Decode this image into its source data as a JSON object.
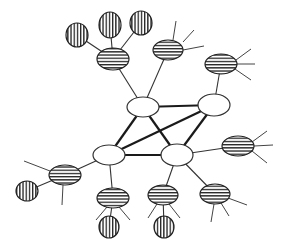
{
  "diagram": {
    "type": "network-graph",
    "colors": {
      "background": "#ffffff",
      "line": "#222222",
      "hub_fill": "#ffffff"
    },
    "legend": {
      "hub": "plain white ellipse",
      "cluster": "horizontally striped ellipse",
      "leaf": "vertically striped circle"
    },
    "hubs": [
      {
        "id": "A",
        "cx": 143,
        "cy": 107,
        "rx": 16,
        "ry": 10
      },
      {
        "id": "B",
        "cx": 214,
        "cy": 105,
        "rx": 16,
        "ry": 11
      },
      {
        "id": "C",
        "cx": 109,
        "cy": 155,
        "rx": 16,
        "ry": 10
      },
      {
        "id": "D",
        "cx": 177,
        "cy": 155,
        "rx": 16,
        "ry": 11
      }
    ],
    "core_edges": [
      [
        "A",
        "B"
      ],
      [
        "A",
        "C"
      ],
      [
        "A",
        "D"
      ],
      [
        "B",
        "C"
      ],
      [
        "B",
        "D"
      ],
      [
        "C",
        "D"
      ]
    ],
    "clusters": [
      {
        "id": "H1",
        "cx": 113,
        "cy": 59,
        "rx": 16,
        "ry": 11,
        "parent": "A"
      },
      {
        "id": "H2",
        "cx": 168,
        "cy": 50,
        "rx": 15,
        "ry": 10,
        "parent": "A"
      },
      {
        "id": "H3",
        "cx": 221,
        "cy": 64,
        "rx": 16,
        "ry": 10,
        "parent": "B"
      },
      {
        "id": "H4",
        "cx": 238,
        "cy": 146,
        "rx": 16,
        "ry": 10,
        "parent": "D"
      },
      {
        "id": "H5",
        "cx": 65,
        "cy": 175,
        "rx": 16,
        "ry": 10,
        "parent": "C"
      },
      {
        "id": "H6",
        "cx": 113,
        "cy": 198,
        "rx": 16,
        "ry": 10,
        "parent": "C"
      },
      {
        "id": "H7",
        "cx": 163,
        "cy": 195,
        "rx": 15,
        "ry": 10,
        "parent": "D"
      },
      {
        "id": "H8",
        "cx": 215,
        "cy": 194,
        "rx": 15,
        "ry": 10,
        "parent": "D"
      }
    ],
    "leaves": [
      {
        "id": "V1",
        "cx": 77,
        "cy": 35,
        "rx": 11,
        "ry": 12,
        "parent": "H1"
      },
      {
        "id": "V2",
        "cx": 110,
        "cy": 25,
        "rx": 11,
        "ry": 13,
        "parent": "H1"
      },
      {
        "id": "V3",
        "cx": 141,
        "cy": 23,
        "rx": 11,
        "ry": 12,
        "parent": "H1"
      },
      {
        "id": "V4",
        "cx": 27,
        "cy": 191,
        "rx": 11,
        "ry": 10,
        "parent": "H5"
      },
      {
        "id": "V5",
        "cx": 109,
        "cy": 227,
        "rx": 10,
        "ry": 11,
        "parent": "H6"
      },
      {
        "id": "V6",
        "cx": 164,
        "cy": 227,
        "rx": 10,
        "ry": 11,
        "parent": "H7"
      }
    ],
    "spokes": [
      [
        176,
        21,
        173,
        40
      ],
      [
        183,
        42,
        194,
        30
      ],
      [
        183,
        50,
        204,
        46
      ],
      [
        236,
        60,
        251,
        49
      ],
      [
        237,
        64,
        255,
        64
      ],
      [
        235,
        69,
        251,
        80
      ],
      [
        252,
        142,
        267,
        131
      ],
      [
        254,
        146,
        273,
        145
      ],
      [
        252,
        151,
        267,
        163
      ],
      [
        50,
        171,
        24,
        161
      ],
      [
        63,
        185,
        62,
        205
      ],
      [
        107,
        207,
        96,
        220
      ],
      [
        119,
        207,
        130,
        220
      ],
      [
        157,
        204,
        148,
        218
      ],
      [
        169,
        204,
        180,
        218
      ],
      [
        228,
        198,
        247,
        205
      ],
      [
        221,
        203,
        229,
        216
      ],
      [
        214,
        204,
        211,
        222
      ]
    ]
  }
}
